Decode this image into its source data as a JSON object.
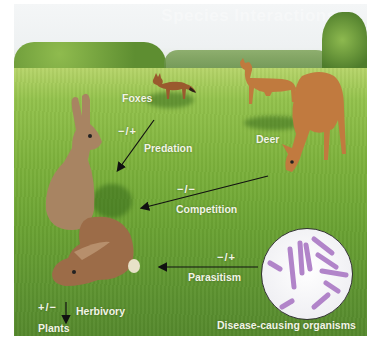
{
  "title": "Species Interactions",
  "organisms": {
    "foxes": "Foxes",
    "deer": "Deer",
    "plants": "Plants",
    "disease": "Disease-causing organisms"
  },
  "interactions": [
    {
      "name": "Predation",
      "sign": "−/+",
      "from": "Foxes",
      "to": "Rabbits"
    },
    {
      "name": "Competition",
      "sign": "−/−",
      "from": "Deer",
      "to": "Rabbits"
    },
    {
      "name": "Parasitism",
      "sign": "−/+",
      "from": "Disease-causing organisms",
      "to": "Rabbits"
    },
    {
      "name": "Herbivory",
      "sign": "+/−",
      "from": "Rabbits",
      "to": "Plants"
    }
  ],
  "colors": {
    "grass": "#6aa233",
    "label": "#f2f4e6",
    "bacteria": "#b184c9",
    "fur_rabbit": "#a88462",
    "fur_deer": "#c07a3e",
    "fur_fox": "#9a5a2e"
  }
}
